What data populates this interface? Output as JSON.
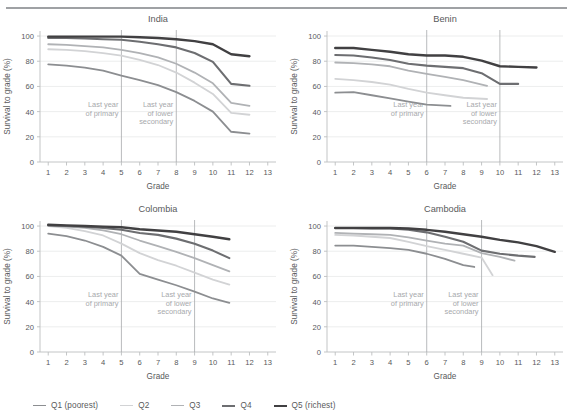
{
  "figure": {
    "title_rule": true,
    "background": "#ffffff",
    "text_color": "#58595b",
    "grid_color": "#e7e8e9",
    "axis_color": "#bcbec0",
    "vline_color": "#a7a9ac",
    "annotation_color": "#a7a9ac"
  },
  "legend": {
    "position": "bottom-left",
    "items": [
      {
        "label": "Q1 (poorest)",
        "color": "#8c8e91",
        "width": 1.8
      },
      {
        "label": "Q2",
        "color": "#d2d3d5",
        "width": 1.8
      },
      {
        "label": "Q3",
        "color": "#b0b2b5",
        "width": 1.8
      },
      {
        "label": "Q4",
        "color": "#6d6e71",
        "width": 2.1
      },
      {
        "label": "Q5 (richest)",
        "color": "#414042",
        "width": 2.4
      }
    ]
  },
  "chart_data": [
    {
      "type": "line",
      "title": "India",
      "xlabel": "Grade",
      "ylabel": "Survival to grade (%)",
      "xlim": [
        0.55,
        13.45
      ],
      "ylim": [
        0,
        104
      ],
      "xticks": [
        1,
        2,
        3,
        4,
        5,
        6,
        7,
        8,
        9,
        10,
        11,
        12,
        13
      ],
      "yticks": [
        0,
        20,
        40,
        60,
        80,
        100
      ],
      "grid": "horizontal",
      "annotations": [
        {
          "text": "Last year\nof primary",
          "x": 5
        },
        {
          "text": "Last year\nof lower\nsecondary",
          "x": 8
        }
      ],
      "vlines": [
        5,
        8
      ],
      "series": [
        {
          "name": "Q1 (poorest)",
          "color": "#8c8e91",
          "x": [
            1,
            2,
            3,
            4,
            5,
            6,
            7,
            8,
            9,
            10,
            11,
            12
          ],
          "y": [
            77.5,
            76.5,
            75.0,
            72.5,
            68.5,
            65.0,
            61.0,
            55.5,
            48.5,
            40.0,
            24.0,
            22.5
          ]
        },
        {
          "name": "Q2",
          "color": "#d2d3d5",
          "x": [
            1,
            2,
            3,
            4,
            5,
            6,
            7,
            8,
            9,
            10,
            11,
            12
          ],
          "y": [
            89.5,
            89.0,
            88.0,
            86.5,
            84.5,
            81.0,
            77.0,
            71.0,
            63.0,
            54.0,
            39.0,
            37.5
          ]
        },
        {
          "name": "Q3",
          "color": "#b0b2b5",
          "x": [
            1,
            2,
            3,
            4,
            5,
            6,
            7,
            8,
            9,
            10,
            11,
            12
          ],
          "y": [
            93.5,
            93.0,
            92.0,
            91.0,
            89.0,
            86.5,
            83.0,
            78.0,
            71.0,
            62.5,
            47.0,
            44.5
          ]
        },
        {
          "name": "Q4",
          "color": "#6d6e71",
          "x": [
            1,
            2,
            3,
            4,
            5,
            6,
            7,
            8,
            9,
            10,
            11,
            12
          ],
          "y": [
            98.5,
            98.5,
            98.0,
            97.5,
            97.0,
            95.5,
            93.5,
            91.0,
            86.5,
            79.5,
            62.0,
            60.5
          ]
        },
        {
          "name": "Q5 (richest)",
          "color": "#414042",
          "x": [
            1,
            2,
            3,
            4,
            5,
            6,
            7,
            8,
            9,
            10,
            11,
            12
          ],
          "y": [
            99.5,
            99.5,
            99.5,
            99.5,
            99.5,
            99.0,
            98.5,
            97.5,
            96.0,
            93.5,
            85.5,
            84.0
          ]
        }
      ]
    },
    {
      "type": "line",
      "title": "Benin",
      "xlabel": "Grade",
      "ylabel": "Survival to grade (%)",
      "xlim": [
        0.55,
        13.45
      ],
      "ylim": [
        0,
        104
      ],
      "xticks": [
        1,
        2,
        3,
        4,
        5,
        6,
        7,
        8,
        9,
        10,
        11,
        12,
        13
      ],
      "yticks": [
        0,
        20,
        40,
        60,
        80,
        100
      ],
      "grid": "horizontal",
      "annotations": [
        {
          "text": "Last year\nof primary",
          "x": 6
        },
        {
          "text": "Last year\nof lower\nsecondary",
          "x": 10
        }
      ],
      "vlines": [
        6,
        10
      ],
      "series": [
        {
          "name": "Q1 (poorest)",
          "color": "#8c8e91",
          "x": [
            1,
            2,
            3,
            4,
            5,
            6,
            7.3
          ],
          "y": [
            55.0,
            55.5,
            53.0,
            50.5,
            48.0,
            45.5,
            44.5
          ]
        },
        {
          "name": "Q2",
          "color": "#d2d3d5",
          "x": [
            1,
            2,
            3,
            4,
            5,
            6,
            7,
            8,
            9.3
          ],
          "y": [
            66.0,
            65.0,
            63.5,
            61.5,
            58.0,
            55.0,
            53.0,
            51.0,
            50.0
          ]
        },
        {
          "name": "Q3",
          "color": "#b0b2b5",
          "x": [
            1,
            2,
            3,
            4,
            5,
            6,
            7,
            8,
            9.3
          ],
          "y": [
            79.0,
            78.5,
            77.5,
            76.0,
            72.5,
            70.0,
            67.5,
            65.0,
            60.5
          ]
        },
        {
          "name": "Q4",
          "color": "#6d6e71",
          "x": [
            1,
            2,
            3,
            4,
            5,
            6,
            7,
            8,
            9,
            10,
            11
          ],
          "y": [
            85.0,
            84.5,
            83.0,
            81.0,
            78.0,
            76.5,
            75.5,
            74.5,
            70.5,
            62.0,
            62.0
          ]
        },
        {
          "name": "Q5 (richest)",
          "color": "#414042",
          "x": [
            1,
            2,
            3,
            4,
            5,
            6,
            7,
            8,
            9,
            10,
            11,
            12
          ],
          "y": [
            90.5,
            90.5,
            89.0,
            87.5,
            85.5,
            84.5,
            84.5,
            83.5,
            80.5,
            76.0,
            75.5,
            75.0
          ]
        }
      ]
    },
    {
      "type": "line",
      "title": "Colombia",
      "xlabel": "Grade",
      "ylabel": "Survival to grade (%)",
      "xlim": [
        0.55,
        13.45
      ],
      "ylim": [
        0,
        104
      ],
      "xticks": [
        1,
        2,
        3,
        4,
        5,
        6,
        7,
        8,
        9,
        10,
        11,
        12,
        13
      ],
      "yticks": [
        0,
        20,
        40,
        60,
        80,
        100
      ],
      "grid": "horizontal",
      "annotations": [
        {
          "text": "Last year\nof primary",
          "x": 5
        },
        {
          "text": "Last year\nof lower\nsecondary",
          "x": 9
        }
      ],
      "vlines": [
        5,
        9
      ],
      "series": [
        {
          "name": "Q1 (poorest)",
          "color": "#8c8e91",
          "x": [
            1,
            2,
            3,
            4,
            5,
            6,
            7,
            8,
            9,
            10,
            10.9
          ],
          "y": [
            94.0,
            92.0,
            88.5,
            83.5,
            76.5,
            62.0,
            57.5,
            53.0,
            48.0,
            42.5,
            39.0
          ]
        },
        {
          "name": "Q2",
          "color": "#d2d3d5",
          "x": [
            1,
            2,
            3,
            4,
            5,
            6,
            7,
            8,
            9,
            10,
            10.9
          ],
          "y": [
            100.0,
            98.5,
            96.0,
            92.5,
            86.0,
            78.5,
            73.0,
            68.5,
            63.0,
            57.5,
            53.5
          ]
        },
        {
          "name": "Q3",
          "color": "#b0b2b5",
          "x": [
            1,
            2,
            3,
            4,
            5,
            6,
            7,
            8,
            9,
            10,
            10.9
          ],
          "y": [
            100.5,
            99.5,
            98.5,
            96.5,
            93.5,
            88.5,
            84.0,
            79.5,
            74.5,
            69.0,
            64.0
          ]
        },
        {
          "name": "Q4",
          "color": "#6d6e71",
          "x": [
            1,
            2,
            3,
            4,
            5,
            6,
            7,
            8,
            9,
            10,
            10.9
          ],
          "y": [
            100.5,
            100.0,
            99.5,
            98.5,
            97.0,
            94.5,
            93.0,
            90.0,
            86.0,
            80.5,
            74.5
          ]
        },
        {
          "name": "Q5 (richest)",
          "color": "#414042",
          "x": [
            1,
            2,
            3,
            4,
            5,
            6,
            7,
            8,
            9,
            10,
            10.9
          ],
          "y": [
            101.0,
            100.5,
            100.0,
            99.5,
            99.0,
            97.5,
            96.5,
            95.5,
            93.5,
            91.5,
            89.5
          ]
        }
      ]
    },
    {
      "type": "line",
      "title": "Cambodia",
      "xlabel": "Grade",
      "ylabel": "Survival to grade (%)",
      "xlim": [
        0.55,
        13.45
      ],
      "ylim": [
        0,
        104
      ],
      "xticks": [
        1,
        2,
        3,
        4,
        5,
        6,
        7,
        8,
        9,
        10,
        11,
        12,
        13
      ],
      "yticks": [
        0,
        20,
        40,
        60,
        80,
        100
      ],
      "grid": "horizontal",
      "annotations": [
        {
          "text": "Last year\nof primary",
          "x": 6
        },
        {
          "text": "Last year\nof lower\nsecondary",
          "x": 9
        }
      ],
      "vlines": [
        6,
        9
      ],
      "series": [
        {
          "name": "Q1 (poorest)",
          "color": "#8c8e91",
          "x": [
            1,
            2,
            3,
            4,
            5,
            6,
            7,
            8,
            8.6
          ],
          "y": [
            84.5,
            84.5,
            83.5,
            82.5,
            81.0,
            78.0,
            74.0,
            69.0,
            67.5
          ]
        },
        {
          "name": "Q2",
          "color": "#d2d3d5",
          "x": [
            1,
            2,
            3,
            4,
            5,
            6,
            7,
            8,
            9,
            9.6
          ],
          "y": [
            93.0,
            92.5,
            91.5,
            90.5,
            87.5,
            84.0,
            81.0,
            78.0,
            75.0,
            61.0
          ]
        },
        {
          "name": "Q3",
          "color": "#b0b2b5",
          "x": [
            1,
            2,
            3,
            4,
            5,
            6,
            7,
            8,
            9,
            10,
            10.8
          ],
          "y": [
            94.5,
            94.0,
            93.5,
            93.0,
            91.0,
            88.5,
            86.0,
            84.5,
            78.5,
            75.5,
            72.5
          ]
        },
        {
          "name": "Q4",
          "color": "#6d6e71",
          "x": [
            1,
            2,
            3,
            4,
            5,
            6,
            7,
            8,
            9,
            10,
            11,
            11.9
          ],
          "y": [
            98.5,
            98.5,
            98.0,
            98.0,
            97.0,
            95.0,
            91.5,
            87.5,
            80.5,
            78.0,
            76.5,
            75.5
          ]
        },
        {
          "name": "Q5 (richest)",
          "color": "#414042",
          "x": [
            1,
            2,
            3,
            4,
            5,
            6,
            7,
            8,
            9,
            10,
            11,
            12,
            13
          ],
          "y": [
            98.5,
            98.5,
            98.5,
            98.5,
            98.0,
            97.0,
            95.5,
            93.5,
            91.5,
            89.0,
            87.0,
            84.0,
            79.5
          ]
        }
      ]
    }
  ]
}
